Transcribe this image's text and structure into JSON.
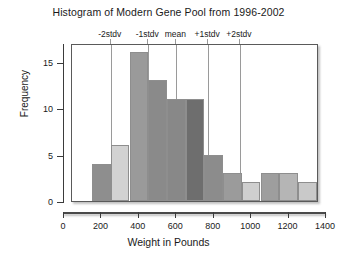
{
  "chart_data": {
    "type": "bar",
    "title": "Histogram of Modern Gene Pool from 1996-2002",
    "xlabel": "Weight in Pounds",
    "ylabel": "Frequency",
    "xlim": [
      0,
      1400
    ],
    "ylim": [
      0,
      17
    ],
    "grid": false,
    "legend": null,
    "bin_width": 100,
    "categories": [
      "150-250",
      "250-350",
      "350-450",
      "450-550",
      "550-650",
      "650-750",
      "750-850",
      "850-950",
      "950-1050",
      "1050-1150",
      "1150-1250",
      "1250-1350"
    ],
    "bin_starts": [
      150,
      250,
      350,
      450,
      550,
      650,
      750,
      850,
      950,
      1050,
      1150,
      1250
    ],
    "values": [
      4,
      6,
      16,
      13,
      11,
      11,
      5,
      3,
      2,
      3,
      3,
      2
    ],
    "bar_colors": [
      "#8e8e8e",
      "#d2d2d2",
      "#9a9a9a",
      "#8a8a8a",
      "#888888",
      "#6e6e6e",
      "#8c8c8c",
      "#9b9b9b",
      "#cfcfcf",
      "#9e9e9e",
      "#b5b5b5",
      "#c9c9c9"
    ],
    "xticks": [
      0,
      200,
      400,
      600,
      800,
      1000,
      1200,
      1400
    ],
    "xticklabels": [
      "0",
      "200",
      "400",
      "600",
      "800",
      "1000",
      "1200",
      "1400"
    ],
    "yticks": [
      0,
      5,
      10,
      15
    ],
    "yticklabels": [
      "0",
      "5",
      "10",
      "15"
    ],
    "annotations": [
      {
        "label": "-2stdv",
        "x": 250
      },
      {
        "label": "-1stdv",
        "x": 450
      },
      {
        "label": "mean",
        "x": 600
      },
      {
        "label": "+1stdv",
        "x": 770
      },
      {
        "label": "+2stdv",
        "x": 940
      }
    ],
    "annotation_line_color": "#9a9a9a"
  }
}
